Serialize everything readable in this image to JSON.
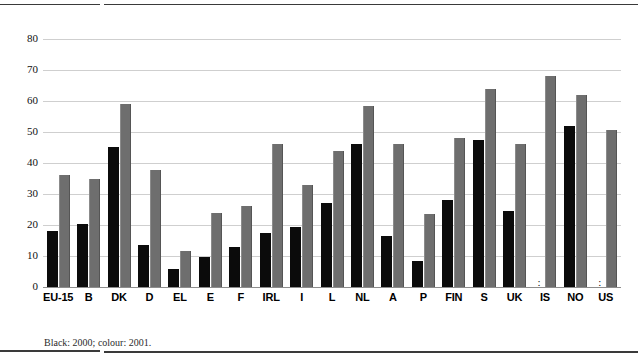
{
  "chart_data": {
    "type": "bar",
    "title": "",
    "xlabel": "",
    "ylabel": "",
    "ylim": [
      0,
      80
    ],
    "yticks": [
      0,
      10,
      20,
      30,
      40,
      50,
      60,
      70,
      80
    ],
    "grid": true,
    "legend_position": "none",
    "missing_value_symbol": ":",
    "categories": [
      "EU-15",
      "B",
      "DK",
      "D",
      "EL",
      "E",
      "F",
      "IRL",
      "I",
      "L",
      "NL",
      "A",
      "P",
      "FIN",
      "S",
      "UK",
      "IS",
      "NO",
      "US"
    ],
    "series": [
      {
        "name": "2000",
        "color": "#0b0b0b",
        "values": [
          18.2,
          20.2,
          45.2,
          13.4,
          5.8,
          9.6,
          12.9,
          17.3,
          19.2,
          27.0,
          46.0,
          16.6,
          8.3,
          28.2,
          47.5,
          24.4,
          null,
          51.8,
          null
        ]
      },
      {
        "name": "2001",
        "color": "#6e6e6e",
        "values": [
          36.0,
          35.0,
          59.0,
          37.8,
          11.7,
          23.8,
          26.0,
          46.2,
          33.0,
          43.8,
          58.5,
          46.2,
          23.7,
          48.0,
          64.0,
          46.2,
          68.0,
          62.0,
          50.5
        ]
      }
    ],
    "annotations": []
  },
  "footnote": "Black: 2000; colour: 2001.",
  "colors": {
    "series_2000": "#0b0b0b",
    "series_2001": "#6e6e6e",
    "gridline": "#cfcfcf",
    "axis": "#8d8d8d",
    "rule": "#3a3a3a",
    "background": "#ffffff"
  }
}
